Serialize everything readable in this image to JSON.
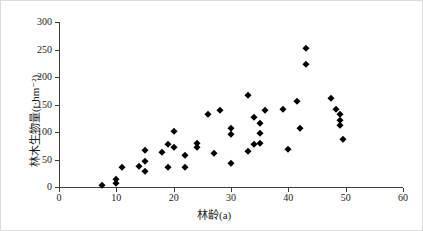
{
  "figure": {
    "background": "#ffffff",
    "border_color": "#dcdcdc"
  },
  "chart_data": {
    "type": "scatter",
    "title": "",
    "xlabel": "林龄(a)",
    "ylabel": "林木生物量(t·hm⁻²)",
    "xlim": [
      0,
      60
    ],
    "ylim": [
      0,
      300
    ],
    "xticks": [
      0,
      10,
      20,
      30,
      40,
      50,
      60
    ],
    "yticks": [
      0,
      50,
      100,
      150,
      200,
      250,
      300
    ],
    "grid": false,
    "legend_position": "none",
    "marker": "diamond",
    "marker_color": "#000000",
    "axis_color": "#3c3c3c",
    "points": [
      [
        7.5,
        4
      ],
      [
        10,
        7
      ],
      [
        10,
        15
      ],
      [
        11,
        37
      ],
      [
        14,
        38
      ],
      [
        15,
        29
      ],
      [
        15,
        47
      ],
      [
        15,
        68
      ],
      [
        18,
        63
      ],
      [
        19,
        36
      ],
      [
        19,
        79
      ],
      [
        20,
        73
      ],
      [
        20,
        102
      ],
      [
        22,
        37
      ],
      [
        22,
        59
      ],
      [
        24,
        73
      ],
      [
        24,
        80
      ],
      [
        26,
        132
      ],
      [
        27,
        62
      ],
      [
        28,
        140
      ],
      [
        30,
        44
      ],
      [
        30,
        96
      ],
      [
        30,
        108
      ],
      [
        33,
        65
      ],
      [
        33,
        168
      ],
      [
        34,
        78
      ],
      [
        34,
        128
      ],
      [
        35,
        80
      ],
      [
        35,
        98
      ],
      [
        35,
        117
      ],
      [
        36,
        140
      ],
      [
        39,
        141
      ],
      [
        40,
        70
      ],
      [
        41.5,
        157
      ],
      [
        42,
        107
      ],
      [
        43,
        223
      ],
      [
        43,
        253
      ],
      [
        47.5,
        161
      ],
      [
        48.4,
        141
      ],
      [
        49,
        133
      ],
      [
        49,
        122
      ],
      [
        49,
        113
      ],
      [
        49.5,
        88
      ]
    ]
  }
}
